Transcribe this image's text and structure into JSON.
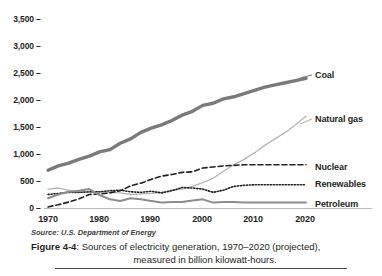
{
  "figure": {
    "source_note": "Source: U.S. Department of Energy",
    "caption_number": "Figure 4-4",
    "caption_line1": ": Sources of electricity generation, 1970–2020 (projected),",
    "caption_line2": "measured in billion kilowatt-hours."
  },
  "chart_data": {
    "type": "line",
    "title": "Sources of electricity generation, 1970–2020 (projected)",
    "subtitle": "measured in billion kilowatt-hours",
    "source": "U.S. Department of Energy",
    "xlabel": "",
    "ylabel": "",
    "xlim": [
      1970,
      2020
    ],
    "ylim": [
      0,
      3500
    ],
    "grid": false,
    "legend_position": "right-inline",
    "x_ticks": [
      "1970",
      "1980",
      "1990",
      "2000",
      "2010",
      "2020"
    ],
    "x_tick_values": [
      1970,
      1980,
      1990,
      2000,
      2010,
      2020
    ],
    "y_ticks": [
      "0",
      "500",
      "1,000",
      "1,500",
      "2,000",
      "2,500",
      "3,000",
      "3,500"
    ],
    "y_tick_values": [
      0,
      500,
      1000,
      1500,
      2000,
      2500,
      3000,
      3500
    ],
    "x": [
      1970,
      1972,
      1974,
      1976,
      1978,
      1980,
      1982,
      1984,
      1986,
      1988,
      1990,
      1992,
      1994,
      1996,
      1998,
      2000,
      2002,
      2004,
      2006,
      2008,
      2010,
      2012,
      2014,
      2016,
      2018,
      2020
    ],
    "series": [
      {
        "name": "Coal",
        "color": "#7a7a7a",
        "style": "solid-thick",
        "label_color": "#231f20",
        "values": [
          700,
          780,
          830,
          900,
          960,
          1040,
          1080,
          1200,
          1280,
          1400,
          1480,
          1540,
          1620,
          1720,
          1790,
          1900,
          1940,
          2020,
          2060,
          2120,
          2180,
          2240,
          2280,
          2320,
          2360,
          2400
        ]
      },
      {
        "name": "Natural gas",
        "color": "#b5b5b5",
        "style": "solid-thin",
        "label_color": "#231f20",
        "values": [
          350,
          370,
          330,
          300,
          290,
          300,
          290,
          280,
          250,
          260,
          270,
          290,
          330,
          350,
          400,
          470,
          550,
          680,
          800,
          900,
          1020,
          1160,
          1280,
          1400,
          1540,
          1700
        ]
      },
      {
        "name": "Nuclear",
        "color": "#231f20",
        "style": "dashed",
        "label_color": "#231f20",
        "values": [
          20,
          60,
          110,
          170,
          250,
          260,
          280,
          320,
          410,
          460,
          530,
          590,
          620,
          660,
          670,
          740,
          760,
          780,
          790,
          800,
          800,
          800,
          800,
          800,
          800,
          800
        ]
      },
      {
        "name": "Renewables",
        "color": "#231f20",
        "style": "dotted",
        "label_color": "#231f20",
        "values": [
          250,
          270,
          290,
          290,
          300,
          300,
          320,
          330,
          300,
          290,
          310,
          280,
          320,
          380,
          370,
          350,
          290,
          330,
          400,
          420,
          430,
          430,
          430,
          430,
          430,
          430
        ]
      },
      {
        "name": "Petroleum",
        "color": "#8c8c8c",
        "style": "solid-medium",
        "label_color": "#231f20",
        "values": [
          180,
          250,
          300,
          320,
          350,
          240,
          160,
          130,
          180,
          160,
          130,
          100,
          110,
          110,
          140,
          160,
          100,
          110,
          110,
          100,
          100,
          100,
          100,
          100,
          100,
          100
        ]
      }
    ],
    "annotations": [
      {
        "text": "Coal",
        "x": 2020,
        "y": 2400
      },
      {
        "text": "Natural gas",
        "x": 2020,
        "y": 1700
      },
      {
        "text": "Nuclear",
        "x": 2020,
        "y": 800
      },
      {
        "text": "Renewables",
        "x": 2020,
        "y": 430
      },
      {
        "text": "Petroleum",
        "x": 2020,
        "y": 100
      }
    ]
  }
}
